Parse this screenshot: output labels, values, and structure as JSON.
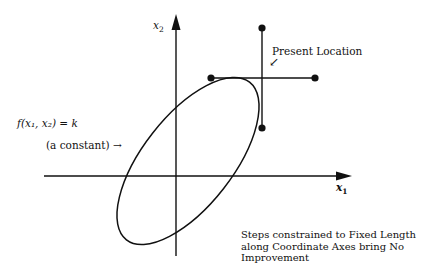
{
  "diagram": {
    "axes": {
      "x_label": "x",
      "x_sub": "1",
      "y_label": "x",
      "y_sub": "2"
    },
    "contour_label": {
      "equation": "f(x₁, x₂) = k",
      "note": "(a constant) →"
    },
    "present_location": {
      "label": "Present Location",
      "arrow": "↙"
    },
    "caption": "Steps constrained to Fixed Length along Coordinate Axes bring No Improvement",
    "points": [
      {
        "name": "present-location",
        "x": 262,
        "y": 78
      },
      {
        "name": "step-up",
        "x": 262,
        "y": 28
      },
      {
        "name": "step-left",
        "x": 211,
        "y": 78
      },
      {
        "name": "step-right",
        "x": 315,
        "y": 78
      },
      {
        "name": "step-down",
        "x": 262,
        "y": 128
      }
    ],
    "colors": {
      "ink": "#111111",
      "background": "#ffffff"
    }
  }
}
